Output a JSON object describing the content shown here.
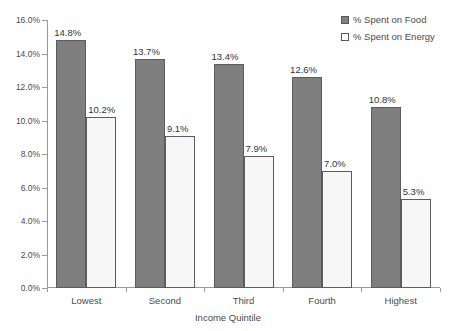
{
  "chart_data": {
    "type": "bar",
    "title": "",
    "subtitle": "",
    "xlabel": "Income Quintile",
    "ylabel": "",
    "categories": [
      "Lowest",
      "Second",
      "Third",
      "Fourth",
      "Highest"
    ],
    "series": [
      {
        "name": "% Spent on Food",
        "values": [
          14.8,
          13.7,
          13.4,
          12.6,
          10.8
        ],
        "labels": [
          "14.8%",
          "13.7%",
          "13.4%",
          "12.6%",
          "10.8%"
        ],
        "color": "#7f7f7f",
        "border_color": "#5c5c5c"
      },
      {
        "name": "% Spent on Energy",
        "values": [
          10.2,
          9.1,
          7.9,
          7.0,
          5.3
        ],
        "labels": [
          "10.2%",
          "9.1%",
          "7.9%",
          "7.0%",
          "5.3%"
        ],
        "color": "#f7f7f7",
        "border_color": "#5c5c5c"
      }
    ],
    "ylim": [
      0.0,
      16.0
    ],
    "yticks": [
      0.0,
      2.0,
      4.0,
      6.0,
      8.0,
      10.0,
      12.0,
      14.0,
      16.0
    ],
    "ytick_labels": [
      "0.0%",
      "2.0%",
      "4.0%",
      "6.0%",
      "8.0%",
      "10.0%",
      "12.0%",
      "14.0%",
      "16.0%"
    ],
    "grid": false,
    "legend_position": "top-right",
    "data_labels_shown": true
  },
  "legend": {
    "entries": [
      {
        "label": "% Spent on Food",
        "swatch": "filled-dark-square"
      },
      {
        "label": "% Spent on Energy",
        "swatch": "outlined-white-square"
      }
    ]
  },
  "axes": {
    "x_title": "Income Quintile",
    "x_categories": [
      "Lowest",
      "Second",
      "Third",
      "Fourth",
      "Highest"
    ],
    "y_labels": [
      "16.0%",
      "14.0%",
      "12.0%",
      "10.0%",
      "8.0%",
      "6.0%",
      "4.0%",
      "2.0%",
      "0.0%"
    ]
  },
  "colors": {
    "food_fill": "#7f7f7f",
    "energy_fill": "#f7f7f7",
    "bar_border": "#5c5c5c",
    "axis": "#9a9a9a",
    "text": "#4a4a4a",
    "background": "#ffffff"
  }
}
